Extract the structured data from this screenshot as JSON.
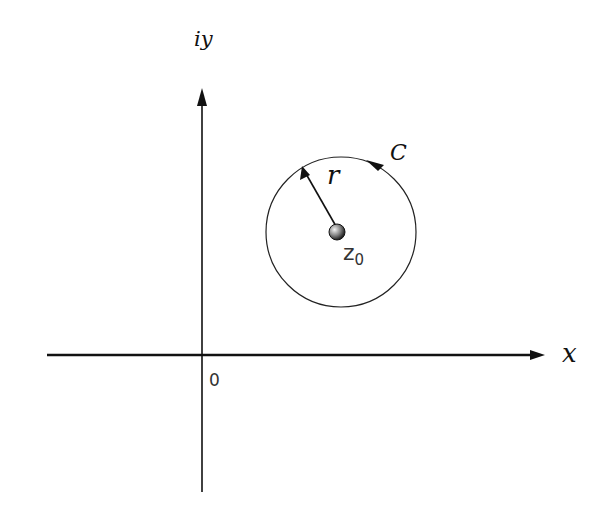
{
  "diagram": {
    "type": "complex-plane-contour",
    "axes": {
      "x_label": "x",
      "y_label": "iy",
      "origin_label": "0"
    },
    "contour": {
      "name": "C",
      "shape": "circle",
      "orientation": "counterclockwise",
      "center_label": "z",
      "center_subscript": "0",
      "radius_label": "r"
    },
    "colors": {
      "line": "#111111",
      "background": "#ffffff"
    }
  }
}
